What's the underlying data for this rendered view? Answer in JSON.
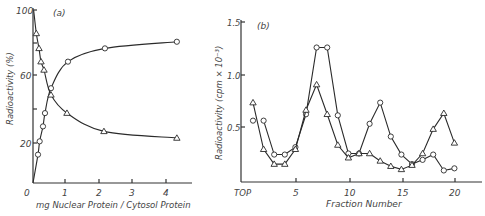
{
  "chart_data": [
    {
      "type": "line",
      "panel_label": "(a)",
      "title": "",
      "xlabel": "mg Nuclear Protein / Cytosol Protein",
      "ylabel": "Radioactivity (%)",
      "xlim": [
        0,
        4.7
      ],
      "ylim": [
        0,
        100
      ],
      "xticks": [
        0,
        1,
        2,
        3,
        4
      ],
      "yticks": [
        20,
        60,
        100
      ],
      "ytick_minor": [
        40,
        80
      ],
      "grid": false,
      "series": [
        {
          "name": "circles",
          "marker": "circle",
          "x": [
            0.15,
            0.2,
            0.3,
            0.36,
            0.54,
            1.05,
            2.16,
            4.32
          ],
          "y": [
            13,
            21,
            30,
            38,
            53,
            69,
            77,
            81
          ]
        },
        {
          "name": "triangles",
          "marker": "triangle",
          "x": [
            0.1,
            0.18,
            0.24,
            0.33,
            0.54,
            1.02,
            2.13,
            4.32
          ],
          "y": [
            86,
            77,
            69,
            64,
            49,
            38,
            27,
            23
          ]
        }
      ]
    },
    {
      "type": "line",
      "panel_label": "(b)",
      "title": "",
      "xlabel": "Fraction Number",
      "ylabel": "Radioactivity (cpm × 10^-3)",
      "xlim": [
        0,
        23
      ],
      "ylim": [
        0,
        1.5
      ],
      "xticks": [
        5,
        10,
        15,
        20
      ],
      "xtick_labels_extra": [
        "TOP"
      ],
      "yticks": [
        0.5,
        1.0,
        1.5
      ],
      "grid": false,
      "series": [
        {
          "name": "circles",
          "marker": "circle",
          "x": [
            1,
            2,
            3,
            4,
            5,
            6,
            7,
            8,
            9,
            10,
            11,
            12,
            13,
            14,
            15,
            16,
            17,
            18,
            19,
            20
          ],
          "y": [
            0.56,
            0.56,
            0.24,
            0.24,
            0.31,
            0.62,
            1.25,
            1.25,
            0.61,
            0.25,
            0.25,
            0.53,
            0.73,
            0.41,
            0.24,
            0.15,
            0.19,
            0.24,
            0.09,
            0.11
          ]
        },
        {
          "name": "triangles",
          "marker": "triangle",
          "x": [
            1,
            2,
            3,
            4,
            5,
            6,
            7,
            8,
            9,
            10,
            11,
            12,
            13,
            14,
            15,
            16,
            17,
            18,
            19,
            20
          ],
          "y": [
            0.73,
            0.29,
            0.15,
            0.15,
            0.29,
            0.66,
            0.9,
            0.62,
            0.33,
            0.21,
            0.25,
            0.25,
            0.18,
            0.13,
            0.1,
            0.14,
            0.25,
            0.48,
            0.63,
            0.35
          ]
        }
      ]
    }
  ],
  "labels": {
    "a_panel": "(a)",
    "a_xlabel": "mg Nuclear Protein / Cytosol Protein",
    "a_ylabel": "Radioactivity (%)",
    "a_y100": "100",
    "a_y60": "60",
    "a_y20": "20",
    "a_x0": "0",
    "a_x1": "1",
    "a_x2": "2",
    "a_x3": "3",
    "a_x4": "4",
    "b_panel": "(b)",
    "b_xlabel": "Fraction Number",
    "b_ylabel": "Radioactivity (cpm × 10⁻³)",
    "b_y15": "1.5",
    "b_y10": "1.0",
    "b_y05": "0.5",
    "b_top": "TOP",
    "b_x5": "5",
    "b_x10": "10",
    "b_x15": "15",
    "b_x20": "20"
  }
}
